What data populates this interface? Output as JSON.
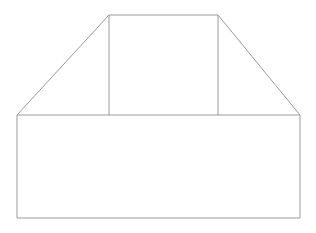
{
  "canvas": {
    "width": 316,
    "height": 233,
    "background_color": "#ffffff",
    "title": "Line drawing of a box with trapezoidal upper section"
  },
  "style": {
    "stroke_color": "#9a9a9a",
    "stroke_color_dark": "#8f8f8f",
    "stroke_width": 1,
    "fill": "none"
  },
  "figure": {
    "name": "trapezoid-on-rectangle-outline",
    "shapes": [
      {
        "id": "base-rectangle",
        "label": "Base rectangle",
        "type": "rectangle",
        "x": 17,
        "y": 115,
        "width": 283,
        "height": 103,
        "points": [
          [
            17,
            115
          ],
          [
            300,
            115
          ],
          [
            300,
            218
          ],
          [
            17,
            218
          ]
        ]
      },
      {
        "id": "trapezoid",
        "label": "Upper trapezoid",
        "type": "polygon",
        "points": [
          [
            17,
            115
          ],
          [
            109,
            15
          ],
          [
            218,
            15
          ],
          [
            300,
            115
          ]
        ]
      },
      {
        "id": "inner-rectangle",
        "label": "Inner rectangle",
        "type": "rectangle",
        "x": 109,
        "y": 15,
        "width": 109,
        "height": 100,
        "points": [
          [
            109,
            15
          ],
          [
            218,
            15
          ],
          [
            218,
            115
          ],
          [
            109,
            115
          ]
        ]
      }
    ],
    "segments": [
      {
        "id": "top-edge",
        "label": "Top edge",
        "x1": 109,
        "y1": 15,
        "x2": 218,
        "y2": 15
      },
      {
        "id": "left-diagonal",
        "label": "Left diagonal",
        "x1": 17,
        "y1": 115,
        "x2": 109,
        "y2": 15
      },
      {
        "id": "right-diagonal",
        "label": "Right diagonal",
        "x1": 218,
        "y1": 15,
        "x2": 300,
        "y2": 115
      },
      {
        "id": "inner-left-vertical",
        "label": "Inner left vertical",
        "x1": 109,
        "y1": 15,
        "x2": 109,
        "y2": 115
      },
      {
        "id": "inner-right-vertical",
        "label": "Inner right vertical",
        "x1": 218,
        "y1": 15,
        "x2": 218,
        "y2": 115
      },
      {
        "id": "middle-horizontal",
        "label": "Middle horizontal",
        "x1": 17,
        "y1": 115,
        "x2": 300,
        "y2": 115
      },
      {
        "id": "base-left-vertical",
        "label": "Base left vertical",
        "x1": 17,
        "y1": 115,
        "x2": 17,
        "y2": 218
      },
      {
        "id": "base-right-vertical",
        "label": "Base right vertical",
        "x1": 300,
        "y1": 115,
        "x2": 300,
        "y2": 218
      },
      {
        "id": "base-bottom",
        "label": "Base bottom edge",
        "x1": 17,
        "y1": 218,
        "x2": 300,
        "y2": 218
      }
    ],
    "vertices": [
      {
        "id": "v-top-left",
        "label": "Top left",
        "x": 109,
        "y": 15
      },
      {
        "id": "v-top-right",
        "label": "Top right",
        "x": 218,
        "y": 15
      },
      {
        "id": "v-mid-left",
        "label": "Middle left",
        "x": 17,
        "y": 115
      },
      {
        "id": "v-mid-right",
        "label": "Middle right",
        "x": 300,
        "y": 115
      },
      {
        "id": "v-mid-inner-l",
        "label": "Middle inner left",
        "x": 109,
        "y": 115
      },
      {
        "id": "v-mid-inner-r",
        "label": "Middle inner right",
        "x": 218,
        "y": 115
      },
      {
        "id": "v-bottom-left",
        "label": "Bottom left",
        "x": 17,
        "y": 218
      },
      {
        "id": "v-bottom-right",
        "label": "Bottom right",
        "x": 300,
        "y": 218
      }
    ]
  }
}
